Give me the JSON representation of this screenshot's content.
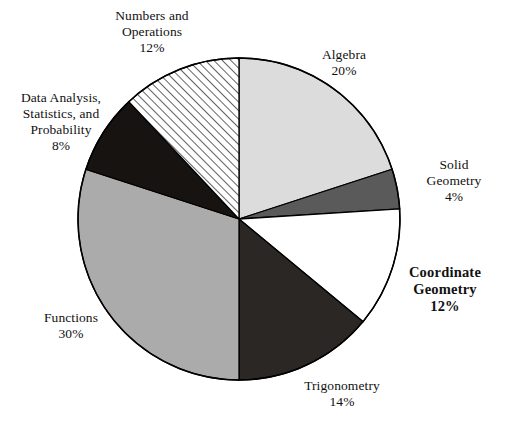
{
  "chart_data": {
    "type": "pie",
    "title": "",
    "subtitle": "",
    "xlabel": "",
    "ylabel": "",
    "legend_position": "none",
    "grid": false,
    "total": 100,
    "units": "%",
    "start_angle_deg": 0,
    "direction": "clockwise",
    "center": {
      "x": 239,
      "y": 219,
      "r": 161
    },
    "categories": [
      "Algebra",
      "Solid Geometry",
      "Coordinate Geometry",
      "Trigonometry",
      "Functions",
      "Data Analysis, Statistics, and Probability",
      "Numbers and Operations"
    ],
    "values": [
      20,
      4,
      12,
      14,
      30,
      8,
      12
    ],
    "slices": [
      {
        "id": "algebra",
        "name": "Algebra",
        "value": 20,
        "percent_text": "20%",
        "fill": "#dcdcdc",
        "pattern": "solid",
        "start_deg": 0,
        "end_deg": 72,
        "label_lines": [
          "Algebra"
        ],
        "emphasis": false
      },
      {
        "id": "solid-geometry",
        "name": "Solid Geometry",
        "value": 4,
        "percent_text": "4%",
        "fill": "#5a5a5a",
        "pattern": "solid",
        "start_deg": 72,
        "end_deg": 86.4,
        "label_lines": [
          "Solid",
          "Geometry"
        ],
        "emphasis": false
      },
      {
        "id": "coordinate-geometry",
        "name": "Coordinate Geometry",
        "value": 12,
        "percent_text": "12%",
        "fill": "#ffffff",
        "pattern": "solid",
        "start_deg": 86.4,
        "end_deg": 129.6,
        "label_lines": [
          "Coordinate",
          "Geometry"
        ],
        "emphasis": true
      },
      {
        "id": "trigonometry",
        "name": "Trigonometry",
        "value": 14,
        "percent_text": "14%",
        "fill": "#2b2724",
        "pattern": "solid",
        "start_deg": 129.6,
        "end_deg": 180,
        "label_lines": [
          "Trigonometry"
        ],
        "emphasis": false
      },
      {
        "id": "functions",
        "name": "Functions",
        "value": 30,
        "percent_text": "30%",
        "fill": "#ababab",
        "pattern": "solid",
        "start_deg": 180,
        "end_deg": 288,
        "label_lines": [
          "Functions"
        ],
        "emphasis": false
      },
      {
        "id": "data-analysis",
        "name": "Data Analysis, Statistics, and Probability",
        "value": 8,
        "percent_text": "8%",
        "fill": "#171310",
        "pattern": "solid",
        "start_deg": 288,
        "end_deg": 316.8,
        "label_lines": [
          "Data Analysis,",
          "Statistics, and",
          "Probability"
        ],
        "emphasis": false
      },
      {
        "id": "numbers-operations",
        "name": "Numbers and Operations",
        "value": 12,
        "percent_text": "12%",
        "fill": "#ffffff",
        "pattern": "diagonal-hatch",
        "start_deg": 316.8,
        "end_deg": 360,
        "label_lines": [
          "Numbers and",
          "Operations"
        ],
        "emphasis": false
      }
    ],
    "colors": {
      "outline": "#000000",
      "text": "#111111",
      "background": "#ffffff",
      "hatch_line": "#333333"
    }
  }
}
